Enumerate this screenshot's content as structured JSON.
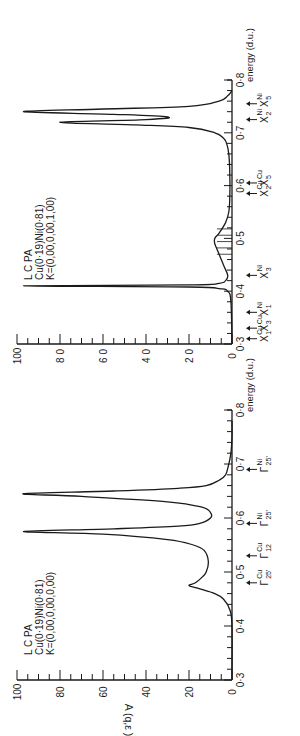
{
  "chart_data": [
    {
      "type": "line",
      "panel": "top",
      "title_lines": [
        "L C PA",
        "Cu(0·19)Ni(0·81)",
        "K=(0,00,0,00,1,00)"
      ],
      "xlabel": "energy (d.u.)",
      "ylabel": "",
      "xlim": [
        0.3,
        0.8
      ],
      "ylim": [
        0,
        100
      ],
      "x_ticks": [
        {
          "value": 0.3,
          "label": "0·3"
        },
        {
          "value": 0.4,
          "label": "0·4"
        },
        {
          "value": 0.5,
          "label": "0·5"
        },
        {
          "value": 0.6,
          "label": "0·6"
        },
        {
          "value": 0.7,
          "label": "0·7"
        },
        {
          "value": 0.8,
          "label": "0·8"
        }
      ],
      "y_ticks": [
        {
          "value": 0,
          "label": "0"
        },
        {
          "value": 20,
          "label": "2 0"
        },
        {
          "value": 40,
          "label": "4 0"
        },
        {
          "value": 60,
          "label": "6 0"
        },
        {
          "value": 80,
          "label": "8 0"
        },
        {
          "value": 100,
          "label": "100"
        }
      ],
      "annotations": [
        {
          "x": 0.31,
          "label": "X",
          "sub": "1",
          "sup": "Cu"
        },
        {
          "x": 0.33,
          "label": "X",
          "sub": "3",
          "sup": "Cu"
        },
        {
          "x": 0.36,
          "label": "X",
          "sub": "1",
          "sup": "Ni"
        },
        {
          "x": 0.43,
          "label": "X",
          "sub": "3",
          "sup": "Ni"
        },
        {
          "x": 0.585,
          "label": "X",
          "sub": "2",
          "sup": "Cu"
        },
        {
          "x": 0.605,
          "label": "X",
          "sub": "5",
          "sup": "Cu"
        },
        {
          "x": 0.725,
          "label": "X",
          "sub": "2",
          "sup": "Ni"
        },
        {
          "x": 0.755,
          "label": "X",
          "sub": "5",
          "sup": "Ni"
        }
      ],
      "series": [
        {
          "name": "A(q,E)",
          "x": [
            0.3,
            0.38,
            0.4,
            0.405,
            0.408,
            0.41,
            0.412,
            0.415,
            0.42,
            0.43,
            0.45,
            0.47,
            0.49,
            0.5,
            0.51,
            0.53,
            0.55,
            0.58,
            0.62,
            0.66,
            0.68,
            0.69,
            0.7,
            0.71,
            0.715,
            0.72,
            0.725,
            0.73,
            0.735,
            0.74,
            0.745,
            0.75,
            0.76,
            0.77,
            0.78
          ],
          "y": [
            0,
            0.5,
            2,
            6,
            20,
            97,
            20,
            6,
            3,
            2,
            4,
            6,
            8,
            8,
            6,
            3,
            1.5,
            1,
            1,
            1.5,
            2.5,
            4,
            8,
            20,
            45,
            80,
            40,
            30,
            55,
            97,
            60,
            20,
            6,
            2,
            0
          ]
        }
      ]
    },
    {
      "type": "line",
      "panel": "bottom",
      "title_lines": [
        "L C PA",
        "Cu(0·19)Ni(0·81)",
        "K=(0,00,0,00,0,00)"
      ],
      "xlabel": "energy (d.u.)",
      "ylabel": "A (q,ε )",
      "xlim": [
        0.3,
        0.8
      ],
      "ylim": [
        0,
        100
      ],
      "x_ticks": [
        {
          "value": 0.3,
          "label": "0·3"
        },
        {
          "value": 0.4,
          "label": "0·4"
        },
        {
          "value": 0.5,
          "label": "0·5"
        },
        {
          "value": 0.6,
          "label": "0·6"
        },
        {
          "value": 0.7,
          "label": "0·7"
        },
        {
          "value": 0.8,
          "label": "0·8"
        }
      ],
      "y_ticks": [
        {
          "value": 0,
          "label": "0"
        },
        {
          "value": 20,
          "label": "20"
        },
        {
          "value": 40,
          "label": "40"
        },
        {
          "value": 60,
          "label": "60"
        },
        {
          "value": 80,
          "label": "80"
        },
        {
          "value": 100,
          "label": "100"
        }
      ],
      "annotations": [
        {
          "x": 0.48,
          "label": "Γ",
          "sub": "25'",
          "sup": "Cu"
        },
        {
          "x": 0.53,
          "label": "Γ",
          "sub": "12",
          "sup": "Cu"
        },
        {
          "x": 0.59,
          "label": "Γ",
          "sub": "25'",
          "sup": "Ni"
        },
        {
          "x": 0.69,
          "label": "Γ",
          "sub": "25'",
          "sup": "Ni"
        }
      ],
      "series": [
        {
          "name": "A(q,E)",
          "x": [
            0.3,
            0.4,
            0.43,
            0.45,
            0.46,
            0.47,
            0.475,
            0.48,
            0.49,
            0.5,
            0.52,
            0.54,
            0.55,
            0.56,
            0.57,
            0.575,
            0.58,
            0.585,
            0.59,
            0.6,
            0.61,
            0.62,
            0.63,
            0.64,
            0.645,
            0.65,
            0.655,
            0.66,
            0.67,
            0.68,
            0.7,
            0.72,
            0.75,
            0.78
          ],
          "y": [
            0,
            0,
            1,
            4,
            8,
            16,
            20,
            17,
            14,
            12,
            11,
            13,
            18,
            30,
            60,
            97,
            55,
            25,
            15,
            10,
            10,
            14,
            30,
            70,
            97,
            55,
            25,
            12,
            6,
            3,
            1.5,
            0.5,
            0,
            0
          ]
        }
      ]
    }
  ]
}
